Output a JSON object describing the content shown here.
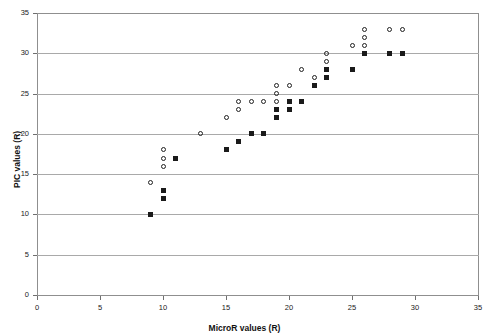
{
  "chart_data": {
    "type": "scatter",
    "title": "",
    "xlabel": "MicroR values (R)",
    "ylabel": "PIC values (R)",
    "xlim": [
      0,
      35
    ],
    "ylim": [
      0,
      35
    ],
    "xticks": [
      0,
      5,
      10,
      15,
      20,
      25,
      30,
      35
    ],
    "yticks": [
      0,
      5,
      10,
      15,
      20,
      25,
      30,
      35
    ],
    "grid": "horizontal",
    "legend": "none",
    "series": [
      {
        "name": "open-circles",
        "marker": "open-circle",
        "color": "#202020",
        "points": [
          [
            9,
            14
          ],
          [
            10,
            16
          ],
          [
            10,
            17
          ],
          [
            10,
            18
          ],
          [
            13,
            20
          ],
          [
            15,
            22
          ],
          [
            16,
            23
          ],
          [
            16,
            24
          ],
          [
            17,
            24
          ],
          [
            18,
            24
          ],
          [
            19,
            24
          ],
          [
            19,
            25
          ],
          [
            19,
            26
          ],
          [
            20,
            26
          ],
          [
            21,
            28
          ],
          [
            22,
            27
          ],
          [
            23,
            29
          ],
          [
            23,
            30
          ],
          [
            25,
            31
          ],
          [
            26,
            31
          ],
          [
            26,
            32
          ],
          [
            26,
            33
          ],
          [
            28,
            33
          ],
          [
            29,
            33
          ]
        ]
      },
      {
        "name": "filled-squares",
        "marker": "filled-square",
        "color": "#1a1a1a",
        "points": [
          [
            9,
            10
          ],
          [
            10,
            12
          ],
          [
            10,
            13
          ],
          [
            11,
            17
          ],
          [
            15,
            18
          ],
          [
            16,
            19
          ],
          [
            17,
            20
          ],
          [
            18,
            20
          ],
          [
            19,
            22
          ],
          [
            19,
            23
          ],
          [
            20,
            23
          ],
          [
            20,
            24
          ],
          [
            21,
            24
          ],
          [
            22,
            26
          ],
          [
            23,
            27
          ],
          [
            23,
            28
          ],
          [
            25,
            28
          ],
          [
            26,
            30
          ],
          [
            28,
            30
          ],
          [
            29,
            30
          ]
        ]
      }
    ]
  },
  "geometry": {
    "plot_left": 37,
    "plot_top": 13,
    "plot_right": 478,
    "plot_bottom": 295
  }
}
